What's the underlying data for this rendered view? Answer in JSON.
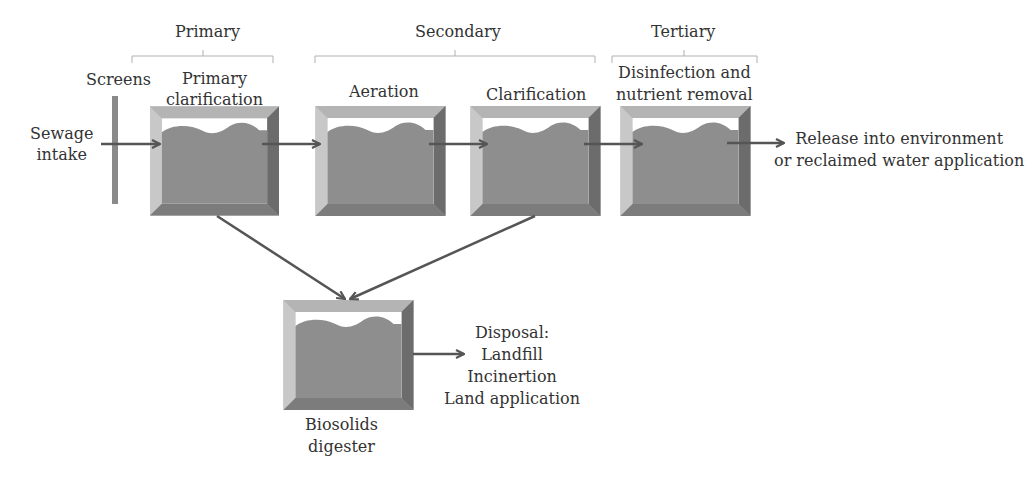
{
  "stages": {
    "primary": "Primary",
    "secondary": "Secondary",
    "tertiary": "Tertiary"
  },
  "inputs": {
    "intake_line1": "Sewage",
    "intake_line2": "intake",
    "screens": "Screens"
  },
  "tanks": [
    {
      "id": "primary-clarification",
      "line1": "Primary",
      "line2": "clarification"
    },
    {
      "id": "aeration",
      "line1": "Aeration"
    },
    {
      "id": "clarification",
      "line1": "Clarification"
    },
    {
      "id": "disinfection",
      "line1": "Disinfection and",
      "line2": "nutrient removal"
    },
    {
      "id": "biosolids-digester",
      "line1": "Biosolids",
      "line2": "digester"
    }
  ],
  "outputs": {
    "release_line1": "Release into environment",
    "release_line2": "or reclaimed water application",
    "disposal_title": "Disposal:",
    "disposal_items": [
      "Landfill",
      "Incinertion",
      "Land application"
    ]
  },
  "colors": {
    "tank_fill": "#8c8c8c",
    "tank_frame_light": "#c4c4c4",
    "tank_frame_dark": "#6e6e6e",
    "arrow": "#555555",
    "bracket": "#b0b0b0",
    "text": "#333333"
  }
}
